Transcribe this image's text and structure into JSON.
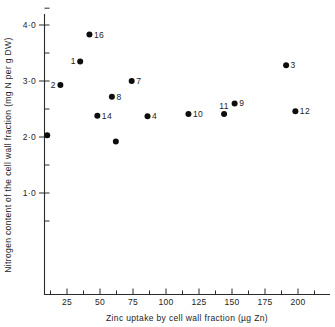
{
  "chart_data": {
    "type": "scatter",
    "title": "",
    "xlabel": "Zinc uptake by cell wall fraction (µg Zn)",
    "ylabel": "Nitrogen content of the cell wall fraction (mg N per g DW)",
    "xlim": [
      0,
      215
    ],
    "ylim": [
      0.5,
      4.3
    ],
    "grid": false,
    "legend": null,
    "xticks": [
      25,
      50,
      75,
      100,
      125,
      150,
      175,
      200
    ],
    "xtick_labels": [
      "25",
      "50",
      "75",
      "100",
      "125",
      "150",
      "175",
      "200"
    ],
    "x_minor_ticks": [
      12.5,
      37.5,
      62.5,
      87.5,
      112.5,
      137.5,
      162.5,
      187.5,
      212.5
    ],
    "yticks": [
      1.0,
      2.0,
      3.0,
      4.0
    ],
    "ytick_labels": [
      "1·0",
      "2·0",
      "3·0",
      "4·0"
    ],
    "y_minor_ticks": [
      0.5,
      1.5,
      2.5,
      3.5,
      4.3
    ],
    "points": [
      {
        "label": "",
        "x": 10,
        "y": 2.03,
        "label_pos": "none"
      },
      {
        "label": "2",
        "x": 20,
        "y": 2.93,
        "label_pos": "left"
      },
      {
        "label": "1",
        "x": 35,
        "y": 3.35,
        "label_pos": "left"
      },
      {
        "label": "16",
        "x": 42,
        "y": 3.83,
        "label_pos": "right"
      },
      {
        "label": "14",
        "x": 48,
        "y": 2.38,
        "label_pos": "right"
      },
      {
        "label": "8",
        "x": 59,
        "y": 2.72,
        "label_pos": "right"
      },
      {
        "label": "",
        "x": 62,
        "y": 1.92,
        "label_pos": "none"
      },
      {
        "label": "7",
        "x": 74,
        "y": 3.0,
        "label_pos": "right"
      },
      {
        "label": "4",
        "x": 86,
        "y": 2.37,
        "label_pos": "right"
      },
      {
        "label": "10",
        "x": 117,
        "y": 2.41,
        "label_pos": "right"
      },
      {
        "label": "11",
        "x": 144,
        "y": 2.41,
        "label_pos": "above"
      },
      {
        "label": "9",
        "x": 152,
        "y": 2.6,
        "label_pos": "right"
      },
      {
        "label": "3",
        "x": 191,
        "y": 3.28,
        "label_pos": "right"
      },
      {
        "label": "12",
        "x": 198,
        "y": 2.46,
        "label_pos": "right"
      }
    ]
  }
}
